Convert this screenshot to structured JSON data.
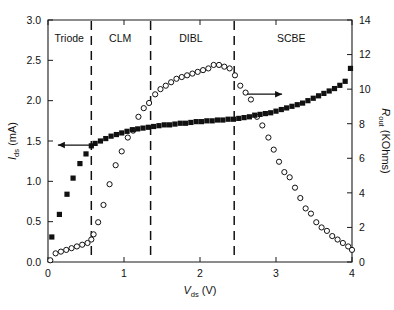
{
  "chart_data": {
    "type": "scatter",
    "title": "",
    "xlabel": "V_ds (V)",
    "xlabel_parts": {
      "symbol": "V",
      "subscript": "ds",
      "unit": "(V)"
    },
    "ylabel_left": "I_ds (mA)",
    "ylabel_left_parts": {
      "symbol": "I",
      "subscript": "ds",
      "unit": "(mA)"
    },
    "ylabel_right": "R_out (KOhms)",
    "ylabel_right_parts": {
      "symbol": "R",
      "subscript": "out",
      "unit": "(KOhms)"
    },
    "xlim": [
      0,
      4
    ],
    "xticks": [
      0,
      1,
      2,
      3,
      4
    ],
    "xticklabels": [
      "0",
      "1",
      "2",
      "3",
      "4"
    ],
    "ylim_left": [
      0.0,
      3.0
    ],
    "yticks_left": [
      0.0,
      0.5,
      1.0,
      1.5,
      2.0,
      2.5,
      3.0
    ],
    "yticklabels_left": [
      "0.0",
      "0.5",
      "1.0",
      "1.5",
      "2.0",
      "2.5",
      "3.0"
    ],
    "ylim_right": [
      0,
      14
    ],
    "yticks_right": [
      0,
      2,
      4,
      6,
      8,
      10,
      12,
      14
    ],
    "yticklabels_right": [
      "0",
      "2",
      "4",
      "6",
      "8",
      "10",
      "12",
      "14"
    ],
    "grid": false,
    "legend_position": "none",
    "region_labels": [
      {
        "text": "Triode",
        "x": 0.28
      },
      {
        "text": "CLM",
        "x": 0.95
      },
      {
        "text": "DIBL",
        "x": 1.88
      },
      {
        "text": "SCBE",
        "x": 3.2
      }
    ],
    "region_dividers": [
      0.57,
      1.35,
      2.45
    ],
    "annotations": [
      {
        "name": "left-arrow",
        "direction": "left",
        "x_start": 0.62,
        "x_end": 0.13,
        "y_left": 1.45
      },
      {
        "name": "right-arrow",
        "direction": "right",
        "x_start": 2.62,
        "x_end": 3.08,
        "y_left": 2.08
      }
    ],
    "series": [
      {
        "name": "I_ds (mA)",
        "axis": "left",
        "marker": "filled-square",
        "x": [
          0.05,
          0.15,
          0.25,
          0.33,
          0.42,
          0.5,
          0.57,
          0.62,
          0.69,
          0.76,
          0.83,
          0.9,
          0.97,
          1.04,
          1.11,
          1.18,
          1.25,
          1.32,
          1.39,
          1.46,
          1.53,
          1.6,
          1.67,
          1.74,
          1.81,
          1.88,
          1.95,
          2.02,
          2.09,
          2.16,
          2.23,
          2.3,
          2.37,
          2.44,
          2.51,
          2.58,
          2.65,
          2.72,
          2.79,
          2.86,
          2.93,
          3.0,
          3.07,
          3.14,
          3.21,
          3.28,
          3.35,
          3.42,
          3.49,
          3.56,
          3.63,
          3.7,
          3.77,
          3.84,
          3.91,
          3.98
        ],
        "y": [
          0.31,
          0.59,
          0.84,
          1.04,
          1.22,
          1.34,
          1.44,
          1.47,
          1.5,
          1.53,
          1.56,
          1.58,
          1.6,
          1.62,
          1.64,
          1.65,
          1.66,
          1.67,
          1.68,
          1.69,
          1.7,
          1.7,
          1.71,
          1.72,
          1.72,
          1.73,
          1.74,
          1.74,
          1.75,
          1.75,
          1.76,
          1.76,
          1.77,
          1.77,
          1.78,
          1.79,
          1.8,
          1.82,
          1.83,
          1.84,
          1.85,
          1.87,
          1.89,
          1.91,
          1.93,
          1.95,
          1.97,
          2.0,
          2.03,
          2.06,
          2.09,
          2.12,
          2.15,
          2.19,
          2.24,
          2.4
        ]
      },
      {
        "name": "R_out (KOhms)",
        "axis": "right",
        "marker": "open-circle",
        "x": [
          0.03,
          0.1,
          0.17,
          0.24,
          0.31,
          0.38,
          0.45,
          0.52,
          0.57,
          0.6,
          0.66,
          0.73,
          0.81,
          0.89,
          0.97,
          1.05,
          1.12,
          1.19,
          1.26,
          1.33,
          1.41,
          1.48,
          1.55,
          1.62,
          1.69,
          1.76,
          1.83,
          1.9,
          1.97,
          2.04,
          2.11,
          2.18,
          2.25,
          2.32,
          2.39,
          2.46,
          2.53,
          2.6,
          2.67,
          2.75,
          2.82,
          2.9,
          2.97,
          3.04,
          3.11,
          3.18,
          3.25,
          3.32,
          3.39,
          3.46,
          3.53,
          3.6,
          3.67,
          3.74,
          3.81,
          3.88,
          3.95,
          4.0
        ],
        "y": [
          0.1,
          0.5,
          0.6,
          0.7,
          0.8,
          0.9,
          1.0,
          1.1,
          1.3,
          1.6,
          2.3,
          3.3,
          4.5,
          5.6,
          6.4,
          7.2,
          7.6,
          8.4,
          8.9,
          9.2,
          9.7,
          10.0,
          10.2,
          10.4,
          10.6,
          10.7,
          10.8,
          10.9,
          11.0,
          11.1,
          11.2,
          11.4,
          11.4,
          11.3,
          11.2,
          10.8,
          10.2,
          9.8,
          9.4,
          8.4,
          7.9,
          7.2,
          6.5,
          5.8,
          5.2,
          4.9,
          4.3,
          3.7,
          3.1,
          2.8,
          2.3,
          2.0,
          1.8,
          1.5,
          1.3,
          1.1,
          0.9,
          0.7
        ]
      }
    ]
  }
}
